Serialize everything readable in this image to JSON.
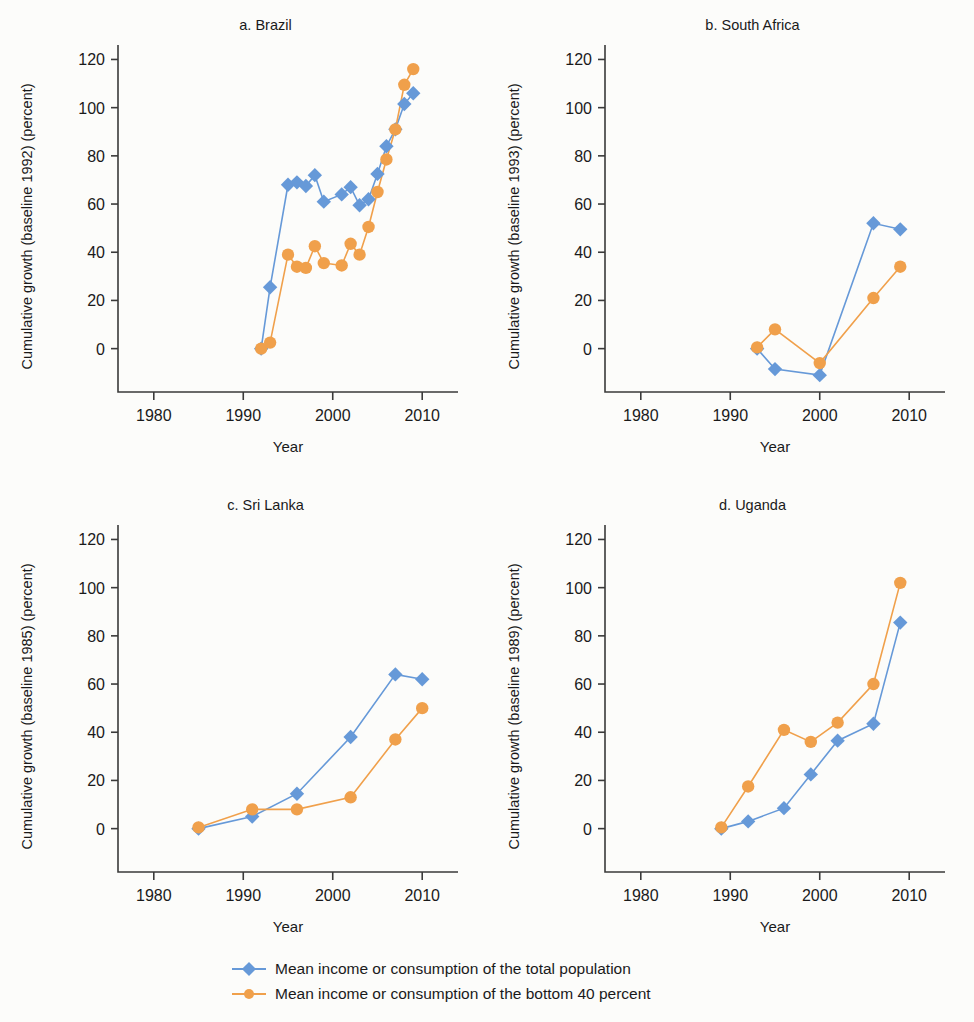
{
  "figure": {
    "background": "#fcfcfa",
    "axis_color": "#3a3a3a"
  },
  "legend": {
    "position": "bottom-center",
    "entries": [
      {
        "label": "Mean income or consumption of the total population",
        "color": "#6699d8",
        "marker": "diamond"
      },
      {
        "label": "Mean income or consumption of the bottom 40 percent",
        "color": "#f0a04b",
        "marker": "circle"
      }
    ]
  },
  "chart_data": [
    {
      "type": "line",
      "panel": "a",
      "title": "a. Brazil",
      "xlabel": "Year",
      "ylabel": "Cumulative growth (baseline 1992) (percent)",
      "xlim": [
        1976,
        2014
      ],
      "ylim": [
        -18,
        126
      ],
      "xticks": [
        1980,
        1990,
        2000,
        2010
      ],
      "yticks": [
        0,
        20,
        40,
        60,
        80,
        100,
        120
      ],
      "grid": false,
      "series": [
        {
          "name": "Mean income or consumption of the total population",
          "color": "#6699d8",
          "marker": "diamond",
          "x": [
            1992,
            1993,
            1995,
            1996,
            1997,
            1998,
            1999,
            2001,
            2002,
            2003,
            2004,
            2005,
            2006,
            2007,
            2008,
            2009
          ],
          "values": [
            0,
            25.5,
            68,
            69,
            67.5,
            72,
            61,
            64,
            67,
            59.5,
            62,
            72.5,
            84,
            91,
            101.5,
            106
          ]
        },
        {
          "name": "Mean income or consumption of the bottom 40 percent",
          "color": "#f0a04b",
          "marker": "circle",
          "x": [
            1992,
            1993,
            1995,
            1996,
            1997,
            1998,
            1999,
            2001,
            2002,
            2003,
            2004,
            2005,
            2006,
            2007,
            2008,
            2009
          ],
          "values": [
            0,
            2.5,
            39,
            34,
            33.5,
            42.5,
            35.5,
            34.5,
            43.5,
            39,
            50.5,
            65,
            78.5,
            91,
            109.5,
            116
          ]
        }
      ]
    },
    {
      "type": "line",
      "panel": "b",
      "title": "b. South Africa",
      "xlabel": "Year",
      "ylabel": "Cumulative growth (baseline 1993) (percent)",
      "xlim": [
        1976,
        2014
      ],
      "ylim": [
        -18,
        126
      ],
      "xticks": [
        1980,
        1990,
        2000,
        2010
      ],
      "yticks": [
        0,
        20,
        40,
        60,
        80,
        100,
        120
      ],
      "grid": false,
      "series": [
        {
          "name": "Mean income or consumption of the total population",
          "color": "#6699d8",
          "marker": "diamond",
          "x": [
            1993,
            1995,
            2000,
            2006,
            2009
          ],
          "values": [
            0,
            -8.5,
            -11,
            52,
            49.5
          ]
        },
        {
          "name": "Mean income or consumption of the bottom 40 percent",
          "color": "#f0a04b",
          "marker": "circle",
          "x": [
            1993,
            1995,
            2000,
            2006,
            2009
          ],
          "values": [
            0.5,
            8,
            -6,
            21,
            34
          ]
        }
      ]
    },
    {
      "type": "line",
      "panel": "c",
      "title": "c. Sri Lanka",
      "xlabel": "Year",
      "ylabel": "Cumulative growth (baseline 1985) (percent)",
      "xlim": [
        1976,
        2014
      ],
      "ylim": [
        -18,
        126
      ],
      "xticks": [
        1980,
        1990,
        2000,
        2010
      ],
      "yticks": [
        0,
        20,
        40,
        60,
        80,
        100,
        120
      ],
      "grid": false,
      "series": [
        {
          "name": "Mean income or consumption of the total population",
          "color": "#6699d8",
          "marker": "diamond",
          "x": [
            1985,
            1991,
            1996,
            2002,
            2007,
            2010
          ],
          "values": [
            0,
            5,
            14.5,
            38,
            64,
            62
          ]
        },
        {
          "name": "Mean income or consumption of the bottom 40 percent",
          "color": "#f0a04b",
          "marker": "circle",
          "x": [
            1985,
            1991,
            1996,
            2002,
            2007,
            2010
          ],
          "values": [
            0.5,
            8,
            8,
            13,
            37,
            50
          ]
        }
      ]
    },
    {
      "type": "line",
      "panel": "d",
      "title": "d. Uganda",
      "xlabel": "Year",
      "ylabel": "Cumulative growth (baseline 1989) (percent)",
      "xlim": [
        1976,
        2014
      ],
      "ylim": [
        -18,
        126
      ],
      "xticks": [
        1980,
        1990,
        2000,
        2010
      ],
      "yticks": [
        0,
        20,
        40,
        60,
        80,
        100,
        120
      ],
      "grid": false,
      "series": [
        {
          "name": "Mean income or consumption of the total population",
          "color": "#6699d8",
          "marker": "diamond",
          "x": [
            1989,
            1992,
            1996,
            1999,
            2002,
            2006,
            2009
          ],
          "values": [
            0,
            3,
            8.5,
            22.5,
            36.5,
            43.5,
            85.5
          ]
        },
        {
          "name": "Mean income or consumption of the bottom 40 percent",
          "color": "#f0a04b",
          "marker": "circle",
          "x": [
            1989,
            1992,
            1996,
            1999,
            2002,
            2006,
            2009
          ],
          "values": [
            0.5,
            17.5,
            41,
            36,
            44,
            60,
            102
          ]
        }
      ]
    }
  ]
}
